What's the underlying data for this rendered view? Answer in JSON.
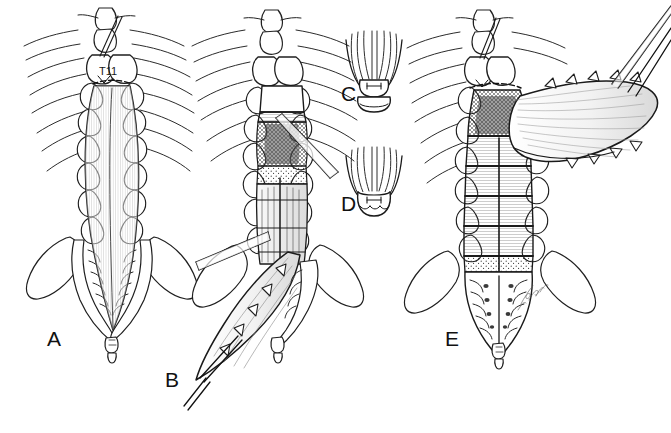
{
  "figure": {
    "kind": "medical-line-illustration",
    "background_color": "#ffffff",
    "ink_color": "#1a1a1a",
    "shading_color": "#6e6e6e",
    "width": 671,
    "height": 433
  },
  "panels": [
    {
      "id": "a",
      "letter": "A",
      "label_position": {
        "x": 47,
        "y": 328
      },
      "description": "Intact posterior view of thoracolumbar spine and sacrum with planned midline osteotomy outline",
      "annotations": [
        {
          "id": "vertebra-level",
          "text": "T11",
          "position": {
            "x": 99,
            "y": 66
          }
        }
      ]
    },
    {
      "id": "b",
      "letter": "B",
      "label_position": {
        "x": 165,
        "y": 369
      },
      "description": "Laminar osteotomy performed, bone flap reflected inferiorly, osteotome and retractor instruments in field"
    },
    {
      "id": "c",
      "letter": "C",
      "label_position": {
        "x": 341,
        "y": 83
      },
      "description": "Inset close-up of osteotomy end with closed rounded trough and marked width"
    },
    {
      "id": "d",
      "letter": "D",
      "label_position": {
        "x": 341,
        "y": 193
      },
      "description": "Inset close-up of osteotomy end with open scalloped trough and marked width"
    },
    {
      "id": "e",
      "letter": "E",
      "label_position": {
        "x": 445,
        "y": 328
      },
      "description": "En-bloc laminar flap reflected laterally to the right, exposing dural sac, lumbar levels and sacral foramina"
    }
  ],
  "signature": {
    "present": true,
    "legible": false,
    "position": {
      "x": 523,
      "y": 290
    }
  }
}
